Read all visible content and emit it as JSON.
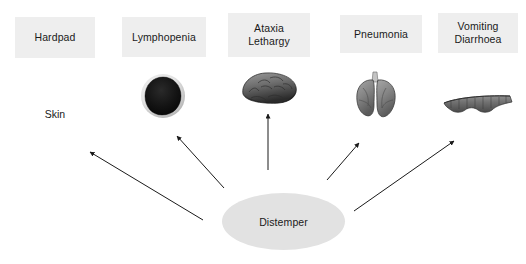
{
  "diagram": {
    "title_text": "Canine distemper clinical signs diagram",
    "background_color": "#ffffff",
    "node_fill_color": "#e2e2e2",
    "box_fill_color": "#eeeeee",
    "arrow_color": "#1a1a1a",
    "root": {
      "label": "Distemper",
      "shape": "ellipse",
      "x": 222,
      "y": 193,
      "width": 123,
      "height": 57
    },
    "signs": [
      {
        "id": "hardpad",
        "label": "Hardpad",
        "box": {
          "x": 15,
          "y": 17,
          "width": 80,
          "height": 41
        },
        "organ_name": "skin",
        "organ_label": "Skin"
      },
      {
        "id": "lymphopenia",
        "label": "Lymphopenia",
        "box": {
          "x": 122,
          "y": 17,
          "width": 84,
          "height": 40
        },
        "organ_name": "lymph-node"
      },
      {
        "id": "ataxia-lethargy",
        "label": "Ataxia\nLethargy",
        "box": {
          "x": 228,
          "y": 13,
          "width": 82,
          "height": 44
        },
        "organ_name": "brain"
      },
      {
        "id": "pneumonia",
        "label": "Pneumonia",
        "box": {
          "x": 340,
          "y": 15,
          "width": 82,
          "height": 38
        },
        "organ_name": "lungs"
      },
      {
        "id": "vomiting-diarrhoea",
        "label": "Vomiting\nDiarrhoea",
        "box": {
          "x": 438,
          "y": 13,
          "width": 80,
          "height": 40
        },
        "organ_name": "intestine"
      }
    ],
    "arrows": [
      {
        "id": "arrow-to-hardpad",
        "x1": 203,
        "y1": 220,
        "x2": 88,
        "y2": 151
      },
      {
        "id": "arrow-to-lymphopenia",
        "x1": 224,
        "y1": 188,
        "x2": 175,
        "y2": 134
      },
      {
        "id": "arrow-to-ataxia",
        "x1": 268,
        "y1": 170,
        "x2": 268,
        "y2": 112
      },
      {
        "id": "arrow-to-pneumonia",
        "x1": 327,
        "y1": 180,
        "x2": 361,
        "y2": 141
      },
      {
        "id": "arrow-to-vomiting",
        "x1": 354,
        "y1": 211,
        "x2": 456,
        "y2": 139
      }
    ]
  }
}
